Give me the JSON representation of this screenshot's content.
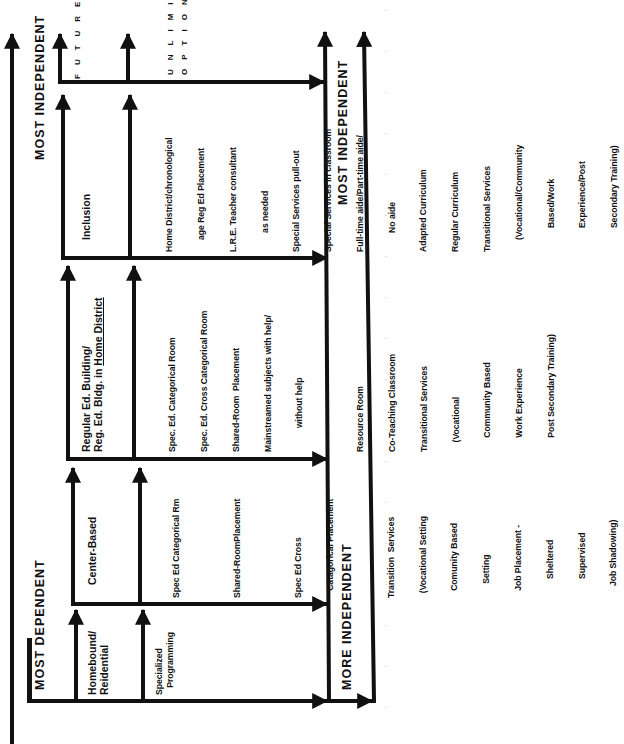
{
  "diagram": {
    "orientation": "rotated 90 degrees counter-clockwise",
    "axis": {
      "left_band_start": "MOST  DEPENDENT",
      "left_band_end": "MOST  INDEPENDENT",
      "right_band_start": "MORE  INDEPENDENT",
      "right_band_end": "MOST  INDEPENDENT"
    },
    "future": {
      "label": "FUTURE",
      "options_line1": "OPTIONS",
      "options_line2": "UNLIMITED"
    },
    "columns": [
      {
        "title_lines": [
          "Homebound/",
          "Reidential"
        ],
        "items": [
          [
            "Specialized",
            "   Programming"
          ]
        ]
      },
      {
        "title_lines": [
          "Center-Based"
        ],
        "items": [
          [
            "Spec Ed Categorical Rm"
          ],
          [
            "Shared-RoomPlacement"
          ],
          [
            "Spec Ed Cross",
            "   Catagorical Placement"
          ],
          [
            "Transition  Services",
            "  (Vocational Setting",
            "   Comunity Based",
            "      Setting",
            "   Job Placement -",
            "        Sheltered",
            "        Supervised",
            "     Job Shadowing)"
          ]
        ]
      },
      {
        "title_lines": [
          "Regular Ed. Building/",
          "Reg. Ed. Bldg. in "
        ],
        "title_underlined": "Home District",
        "items": [
          [
            "Spec. Ed. Categorical Room",
            "Spec. Ed. Cross Categorical Room",
            "Shared-Room  Placement",
            "Mainstreamed subjects with help/",
            "          without help"
          ],
          [
            "Resource Room",
            "Co-Teaching Classroom",
            "Transitional Services",
            "    (Vocational",
            "      Community Based",
            "      Work Experience",
            "      Post Secondary Training)"
          ]
        ]
      },
      {
        "title_lines": [
          "Inclusion"
        ],
        "items": [
          [
            "Home District/chronological",
            "     age Reg Ed Placement",
            "L.R.E. Teacher consultant",
            "        as needed",
            "Special Services pull-out",
            "Special Services in classroom",
            "Full-time aide/Part-time aide/",
            "        No aide",
            "Adapted Curriculum",
            "Regular Curriculum",
            "Transitional Services",
            "     (Vocational/Community",
            "          Based/Work",
            "          Experience/Post",
            "          Secondary Training)"
          ]
        ]
      }
    ],
    "colors": {
      "ink": "#111111",
      "paper": "#ffffff"
    }
  }
}
